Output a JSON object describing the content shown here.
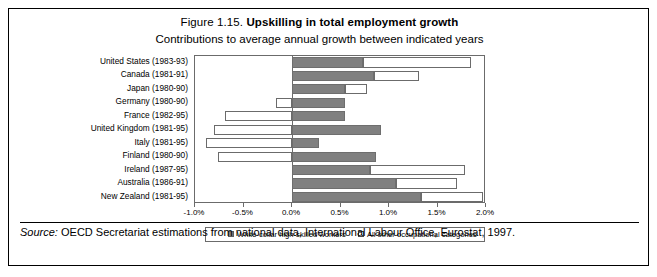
{
  "figure": {
    "number": "Figure 1.15.",
    "title": "Upskilling in total employment growth",
    "subtitle": "Contributions to average annual growth between indicated years",
    "source_label": "Source:",
    "source_text": "OECD Secretariat estimations from national data, International Labour Office, Eurostat, 1997."
  },
  "legend": {
    "series1": "White-collar high-skilled workers",
    "series2": "All other occupational categories"
  },
  "chart_data": {
    "type": "bar",
    "orientation": "horizontal",
    "stacked": true,
    "title": "Upskilling in total employment growth",
    "subtitle": "Contributions to average annual growth between indicated years",
    "xlabel": "",
    "ylabel": "",
    "xlim": [
      -1.0,
      2.0
    ],
    "xticks": [
      -1.0,
      -0.5,
      0.0,
      0.5,
      1.0,
      1.5,
      2.0
    ],
    "xtick_labels": [
      "-1.0%",
      "-0.5%",
      "0.0%",
      "0.5%",
      "1.0%",
      "1.5%",
      "2.0%"
    ],
    "grid": false,
    "legend_position": "bottom",
    "categories": [
      "United States (1983-93)",
      "Canada (1981-91)",
      "Japan (1980-90)",
      "Germany (1980-90)",
      "France (1982-95)",
      "United Kingdom (1981-95)",
      "Italy (1981-95)",
      "Finland (1980-90)",
      "Ireland (1987-95)",
      "Australia (1986-91)",
      "New Zealand (1981-95)"
    ],
    "series": [
      {
        "name": "White-collar high-skilled workers",
        "color": "#808080",
        "values": [
          0.73,
          0.85,
          0.55,
          0.55,
          0.55,
          0.92,
          0.28,
          0.87,
          0.8,
          1.07,
          1.33
        ]
      },
      {
        "name": "All other occupational categories",
        "color": "#ffffff",
        "values": [
          1.12,
          0.46,
          0.22,
          -0.16,
          -0.69,
          -0.8,
          -0.89,
          -0.76,
          0.98,
          0.63,
          0.64
        ]
      }
    ]
  }
}
